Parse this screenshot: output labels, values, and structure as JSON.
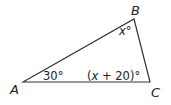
{
  "figure": {
    "type": "triangle",
    "stroke_color": "#333333",
    "background": "#ffffff",
    "vertices": [
      {
        "id": "A",
        "label": "A",
        "x": 23,
        "y": 82
      },
      {
        "id": "B",
        "label": "B",
        "x": 134,
        "y": 19
      },
      {
        "id": "C",
        "label": "C",
        "x": 150,
        "y": 82
      }
    ],
    "angles": {
      "A": {
        "text": "30°"
      },
      "B": {
        "var": "x",
        "deg": "°"
      },
      "C": {
        "open": "(",
        "var": "x",
        "rest": " + 20)",
        "deg": "°"
      }
    }
  }
}
